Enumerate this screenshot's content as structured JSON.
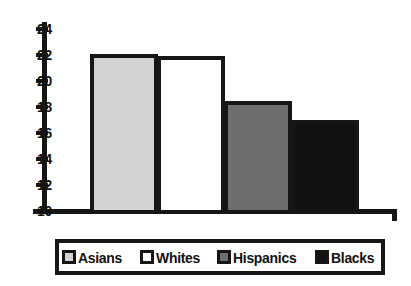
{
  "figure": {
    "cropped_text_remnant": "",
    "background_color": "#ffffff",
    "outline_color": "#161616"
  },
  "chart_data": {
    "type": "bar",
    "title": "",
    "xlabel": "",
    "ylabel": "",
    "ylim": [
      10,
      24
    ],
    "yticks": [
      10,
      12,
      14,
      16,
      18,
      20,
      22,
      24
    ],
    "grid": false,
    "legend_position": "bottom",
    "categories": [
      "Asians",
      "Whites",
      "Hispanics",
      "Blacks"
    ],
    "values": [
      22.1,
      21.9,
      18.5,
      17.0
    ],
    "colors": [
      "#d2d2d2",
      "#ffffff",
      "#6e6e6e",
      "#111111"
    ],
    "series": [
      {
        "name": "",
        "values": [
          22.1,
          21.9,
          18.5,
          17.0
        ]
      }
    ]
  },
  "axis": {
    "tick_labels": [
      "24",
      "22",
      "20",
      "18",
      "16",
      "14",
      "12",
      "10"
    ]
  },
  "legend": {
    "items": [
      {
        "label": "Asians",
        "color": "#d2d2d2"
      },
      {
        "label": "Whites",
        "color": "#ffffff"
      },
      {
        "label": "Hispanics",
        "color": "#6e6e6e"
      },
      {
        "label": "Blacks",
        "color": "#111111"
      }
    ]
  }
}
